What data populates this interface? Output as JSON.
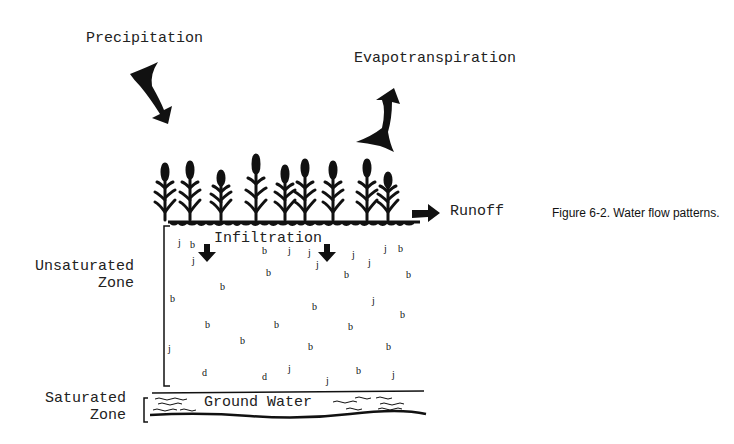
{
  "figure": {
    "caption": "Figure 6-2. Water flow patterns."
  },
  "labels": {
    "precipitation": "Precipitation",
    "evapotranspiration": "Evapotranspiration",
    "runoff": "Runoff",
    "infiltration": "Infiltration",
    "unsaturated_zone_line1": "Unsaturated",
    "unsaturated_zone_line2": "Zone",
    "saturated_zone_line1": "Saturated",
    "saturated_zone_line2": "Zone",
    "ground_water": "Ground Water"
  },
  "icons": {
    "precipitation_arrow": "arrow-down-right-icon",
    "evapotranspiration_arrow": "arrow-up-right-icon",
    "runoff_arrow": "arrow-right-icon",
    "infiltration_arrows": "arrow-down-icon",
    "plants": "plant-icon",
    "water_droplets": "droplet-icon"
  },
  "colors": {
    "ink": "#111111",
    "background": "#ffffff"
  }
}
